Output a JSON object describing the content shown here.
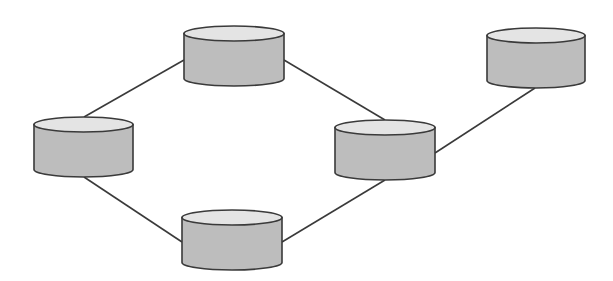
{
  "diagram": {
    "type": "network-topology",
    "colors": {
      "background": "#ffffff",
      "stroke": "#3a3a3a",
      "body_fill": "#bdbdbd",
      "top_fill": "#e4e4e4"
    },
    "nodes": [
      {
        "id": "node-left",
        "x": 34,
        "y": 117,
        "w": 99,
        "h": 60
      },
      {
        "id": "node-top",
        "x": 184,
        "y": 26,
        "w": 100,
        "h": 60
      },
      {
        "id": "node-bottom",
        "x": 182,
        "y": 210,
        "w": 100,
        "h": 60
      },
      {
        "id": "node-middle-right",
        "x": 335,
        "y": 120,
        "w": 100,
        "h": 60
      },
      {
        "id": "node-far-right",
        "x": 487,
        "y": 28,
        "w": 98,
        "h": 60
      }
    ],
    "edges": [
      {
        "from": "node-left",
        "to": "node-top",
        "x1": 84,
        "y1": 117,
        "x2": 184,
        "y2": 60
      },
      {
        "from": "node-top",
        "to": "node-middle-right",
        "x1": 284,
        "y1": 60,
        "x2": 385,
        "y2": 120
      },
      {
        "from": "node-left",
        "to": "node-bottom",
        "x1": 84,
        "y1": 177,
        "x2": 182,
        "y2": 242
      },
      {
        "from": "node-bottom",
        "to": "node-middle-right",
        "x1": 282,
        "y1": 242,
        "x2": 385,
        "y2": 180
      },
      {
        "from": "node-middle-right",
        "to": "node-far-right",
        "x1": 435,
        "y1": 153,
        "x2": 535,
        "y2": 88
      }
    ]
  }
}
